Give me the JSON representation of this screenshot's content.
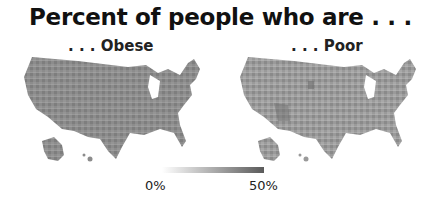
{
  "title": "Percent of people who are . . .",
  "panels": [
    {
      "label": ". . . Obese",
      "region": "United States (counties)",
      "base_color": "#8a8a8a"
    },
    {
      "label": ". . . Poor",
      "region": "United States (counties)",
      "base_color": "#999999"
    }
  ],
  "legend": {
    "min_label": "0%",
    "max_label": "50%",
    "color_low": "#ffffff",
    "color_high": "#5a5a5a"
  }
}
